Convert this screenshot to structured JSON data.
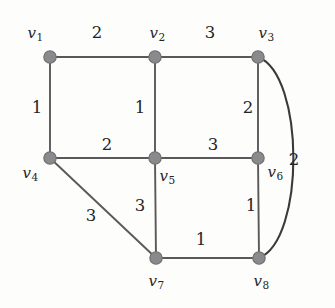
{
  "figure": {
    "kind": "weighted-undirected-graph",
    "background_color": "#fdfdfc",
    "node_color": "#8a8a8c",
    "edge_color": "#59595b",
    "label_color": "#242425",
    "width": 335,
    "height": 308
  },
  "vertices": [
    {
      "id": "v1",
      "label_text": "v",
      "sub": "1",
      "x": 50,
      "y": 57,
      "label_x": 35,
      "label_y": 33
    },
    {
      "id": "v2",
      "label_text": "v",
      "sub": "2",
      "x": 155,
      "y": 57,
      "label_x": 157,
      "label_y": 33
    },
    {
      "id": "v3",
      "label_text": "v",
      "sub": "3",
      "x": 258,
      "y": 57,
      "label_x": 266,
      "label_y": 33
    },
    {
      "id": "v4",
      "label_text": "v",
      "sub": "4",
      "x": 50,
      "y": 158,
      "label_x": 30,
      "label_y": 173
    },
    {
      "id": "v5",
      "label_text": "v",
      "sub": "5",
      "x": 155,
      "y": 158,
      "label_x": 167,
      "label_y": 176
    },
    {
      "id": "v6",
      "label_text": "v",
      "sub": "6",
      "x": 258,
      "y": 158,
      "label_x": 275,
      "label_y": 172
    },
    {
      "id": "v7",
      "label_text": "v",
      "sub": "7",
      "x": 156,
      "y": 258,
      "label_x": 156,
      "label_y": 281
    },
    {
      "id": "v8",
      "label_text": "v",
      "sub": "8",
      "x": 259,
      "y": 258,
      "label_x": 261,
      "label_y": 281
    }
  ],
  "edges": [
    {
      "from": "v1",
      "to": "v2",
      "weight": "2",
      "shape": "straight",
      "weight_x": 97,
      "weight_y": 33
    },
    {
      "from": "v2",
      "to": "v3",
      "weight": "3",
      "shape": "straight",
      "weight_x": 210,
      "weight_y": 33
    },
    {
      "from": "v1",
      "to": "v4",
      "weight": "1",
      "shape": "straight",
      "weight_x": 37,
      "weight_y": 108
    },
    {
      "from": "v2",
      "to": "v5",
      "weight": "1",
      "shape": "straight",
      "weight_x": 140,
      "weight_y": 108
    },
    {
      "from": "v3",
      "to": "v6",
      "weight": "2",
      "shape": "straight",
      "weight_x": 248,
      "weight_y": 108
    },
    {
      "from": "v4",
      "to": "v5",
      "weight": "2",
      "shape": "straight",
      "weight_x": 107,
      "weight_y": 145
    },
    {
      "from": "v5",
      "to": "v6",
      "weight": "3",
      "shape": "straight",
      "weight_x": 213,
      "weight_y": 145
    },
    {
      "from": "v4",
      "to": "v7",
      "weight": "3",
      "shape": "straight",
      "weight_x": 91,
      "weight_y": 216
    },
    {
      "from": "v5",
      "to": "v7",
      "weight": "3",
      "shape": "straight",
      "weight_x": 140,
      "weight_y": 206
    },
    {
      "from": "v6",
      "to": "v8",
      "weight": "1",
      "shape": "straight",
      "weight_x": 251,
      "weight_y": 206
    },
    {
      "from": "v7",
      "to": "v8",
      "weight": "1",
      "shape": "straight",
      "weight_x": 201,
      "weight_y": 240
    },
    {
      "from": "v3",
      "to": "v8",
      "weight": "2",
      "shape": "curved-right",
      "weight_x": 294,
      "weight_y": 160
    }
  ],
  "chart_data": {
    "type": "diagram",
    "title": "",
    "nodes": [
      "v1",
      "v2",
      "v3",
      "v4",
      "v5",
      "v6",
      "v7",
      "v8"
    ],
    "weighted_edges": [
      [
        "v1",
        "v2",
        2
      ],
      [
        "v2",
        "v3",
        3
      ],
      [
        "v1",
        "v4",
        1
      ],
      [
        "v2",
        "v5",
        1
      ],
      [
        "v3",
        "v6",
        2
      ],
      [
        "v4",
        "v5",
        2
      ],
      [
        "v5",
        "v6",
        3
      ],
      [
        "v4",
        "v7",
        3
      ],
      [
        "v5",
        "v7",
        3
      ],
      [
        "v6",
        "v8",
        1
      ],
      [
        "v7",
        "v8",
        1
      ],
      [
        "v3",
        "v8",
        2
      ]
    ]
  }
}
